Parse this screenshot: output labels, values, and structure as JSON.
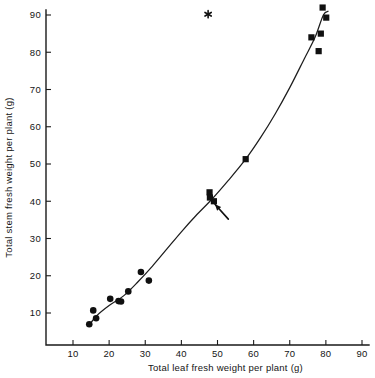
{
  "figure": {
    "background_color": "#ffffff",
    "ink_color": "#101010"
  },
  "chart_data": {
    "type": "scatter",
    "title": "",
    "subtitle": "",
    "xlabel": "Total leaf fresh weight per plant (g)",
    "ylabel": "Total stem fresh weight per plant (g)",
    "xlim": [
      0,
      90
    ],
    "ylim": [
      0,
      92
    ],
    "xticks": [
      10,
      20,
      30,
      40,
      50,
      60,
      70,
      80,
      90
    ],
    "yticks": [
      10,
      20,
      30,
      40,
      50,
      60,
      70,
      80,
      90
    ],
    "xtick_labels": [
      "10",
      "20",
      "30",
      "40",
      "50",
      "60",
      "70",
      "80",
      "90"
    ],
    "ytick_labels": [
      "10",
      "20",
      "30",
      "40",
      "50",
      "60",
      "70",
      "80",
      "90"
    ],
    "grid": false,
    "legend": null,
    "legend_position": "none",
    "series": [
      {
        "name": "low-weight group",
        "marker": "filled-circle",
        "color": "#101010",
        "points": [
          {
            "x": 14.5,
            "y": 7.0
          },
          {
            "x": 15.6,
            "y": 10.7
          },
          {
            "x": 16.4,
            "y": 8.6
          },
          {
            "x": 20.3,
            "y": 13.8
          },
          {
            "x": 22.6,
            "y": 13.2
          },
          {
            "x": 23.3,
            "y": 13.1
          },
          {
            "x": 25.3,
            "y": 15.8
          },
          {
            "x": 28.8,
            "y": 21.0
          },
          {
            "x": 31.0,
            "y": 18.7
          }
        ]
      },
      {
        "name": "high-weight group",
        "marker": "filled-square",
        "color": "#101010",
        "points": [
          {
            "x": 47.8,
            "y": 42.4
          },
          {
            "x": 47.9,
            "y": 41.0
          },
          {
            "x": 49.0,
            "y": 40.0
          },
          {
            "x": 57.8,
            "y": 51.3
          },
          {
            "x": 76.0,
            "y": 84.0
          },
          {
            "x": 78.0,
            "y": 80.3
          },
          {
            "x": 78.6,
            "y": 85.0
          },
          {
            "x": 79.1,
            "y": 92.0
          },
          {
            "x": 80.1,
            "y": 89.3
          }
        ]
      }
    ],
    "fit_curve": {
      "name": "fitted curve",
      "points": [
        {
          "x": 14.3,
          "y": 6.5
        },
        {
          "x": 16.5,
          "y": 9.2
        },
        {
          "x": 20.0,
          "y": 12.0
        },
        {
          "x": 24.0,
          "y": 14.6
        },
        {
          "x": 28.0,
          "y": 18.4
        },
        {
          "x": 32.0,
          "y": 22.6
        },
        {
          "x": 36.0,
          "y": 27.2
        },
        {
          "x": 40.0,
          "y": 31.8
        },
        {
          "x": 44.0,
          "y": 36.1
        },
        {
          "x": 48.5,
          "y": 40.6
        },
        {
          "x": 53.0,
          "y": 45.6
        },
        {
          "x": 57.8,
          "y": 51.3
        },
        {
          "x": 62.0,
          "y": 57.2
        },
        {
          "x": 66.0,
          "y": 63.5
        },
        {
          "x": 70.0,
          "y": 70.5
        },
        {
          "x": 74.0,
          "y": 78.2
        },
        {
          "x": 77.0,
          "y": 84.0
        },
        {
          "x": 79.3,
          "y": 90.0
        },
        {
          "x": 80.6,
          "y": 91.0
        }
      ]
    },
    "annotations": [
      {
        "kind": "asterisk",
        "label": "*",
        "x": 47.4,
        "y": 90.2
      },
      {
        "kind": "arrow",
        "label": "",
        "tip_x": 49.3,
        "tip_y": 39.2,
        "tail_x": 53.0,
        "tail_y": 35.2
      }
    ]
  }
}
